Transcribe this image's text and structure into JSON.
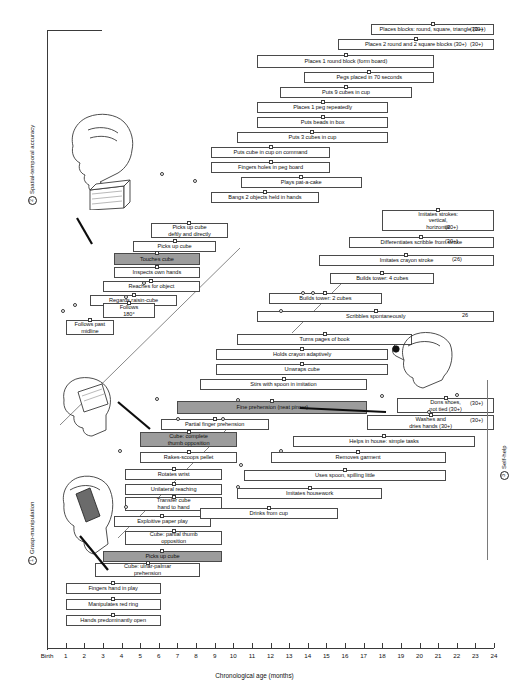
{
  "figure": {
    "axis": {
      "title": "Chronological age (months)",
      "ticks": [
        "Birth",
        "1",
        "2",
        "3",
        "4",
        "5",
        "6",
        "7",
        "8",
        "9",
        "10",
        "11",
        "12",
        "13",
        "14",
        "15",
        "16",
        "17",
        "18",
        "19",
        "20",
        "21",
        "22",
        "23",
        "24"
      ]
    },
    "side_labels": {
      "top_left": {
        "number": "2",
        "text": "Spatial-temporal accuracy"
      },
      "bottom_left": {
        "number": "1",
        "text": "Grasp-manipulation"
      },
      "right": {
        "number": "3",
        "text": "Self-help"
      }
    }
  },
  "chart_data": {
    "type": "bar",
    "xlabel": "Chronological age (months)",
    "ylabel": "",
    "xlim": [
      0,
      24
    ],
    "grid": false,
    "legend": "none",
    "groups": [
      {
        "id": "spatial-temporal-accuracy",
        "number": "2",
        "label": "Spatial-temporal accuracy"
      },
      {
        "id": "grasp-manipulation",
        "number": "1",
        "label": "Grasp-manipulation"
      },
      {
        "id": "self-help",
        "number": "3",
        "label": "Self-help"
      }
    ],
    "milestones": [
      {
        "label": "Places blocks: round, square, triangle (30+)",
        "start": 17.4,
        "end": 24.0,
        "group": "spatial-temporal-accuracy",
        "note": "(30+)",
        "highlight": false
      },
      {
        "label": "Places 2 round and 2 square blocks (30+)",
        "start": 15.6,
        "end": 24.0,
        "group": "spatial-temporal-accuracy",
        "note": "(30+)",
        "highlight": false
      },
      {
        "label": "Places 1 round block (form board)",
        "start": 11.3,
        "end": 20.8,
        "group": "spatial-temporal-accuracy",
        "note": "",
        "highlight": false
      },
      {
        "label": "Pegs placed in 70 seconds",
        "start": 13.8,
        "end": 20.8,
        "group": "spatial-temporal-accuracy",
        "note": "",
        "highlight": false
      },
      {
        "label": "Puts 9 cubes in cup",
        "start": 12.5,
        "end": 19.6,
        "group": "spatial-temporal-accuracy",
        "note": "",
        "highlight": false
      },
      {
        "label": "Places 1 peg repeatedly",
        "start": 11.3,
        "end": 18.3,
        "group": "spatial-temporal-accuracy",
        "note": "",
        "highlight": false
      },
      {
        "label": "Puts beads in box",
        "start": 11.3,
        "end": 18.3,
        "group": "spatial-temporal-accuracy",
        "note": "",
        "highlight": false
      },
      {
        "label": "Puts 3 cubes in cup",
        "start": 10.2,
        "end": 18.3,
        "group": "spatial-temporal-accuracy",
        "note": "",
        "highlight": false
      },
      {
        "label": "Puts cube in cup on command",
        "start": 8.8,
        "end": 15.2,
        "group": "spatial-temporal-accuracy",
        "note": "",
        "highlight": false
      },
      {
        "label": "Fingers holes  in peg board",
        "start": 8.8,
        "end": 15.2,
        "group": "spatial-temporal-accuracy",
        "note": "",
        "highlight": false
      },
      {
        "label": "Plays pat-a-cake",
        "start": 10.4,
        "end": 16.9,
        "group": "spatial-temporal-accuracy",
        "note": "",
        "highlight": false
      },
      {
        "label": "Bangs 2 objects held in hands",
        "start": 8.8,
        "end": 14.6,
        "group": "spatial-temporal-accuracy",
        "note": "",
        "highlight": false
      },
      {
        "label": "Picks up cube\ndeftly and directly",
        "start": 5.6,
        "end": 9.7,
        "group": "spatial-temporal-accuracy",
        "note": "",
        "highlight": false
      },
      {
        "label": "Picks up cube",
        "start": 4.6,
        "end": 9.1,
        "group": "spatial-temporal-accuracy",
        "note": "",
        "highlight": false
      },
      {
        "label": "Touches cube",
        "start": 3.6,
        "end": 8.2,
        "group": "spatial-temporal-accuracy",
        "note": "",
        "highlight": true
      },
      {
        "label": "Inspects own hands",
        "start": 3.6,
        "end": 8.2,
        "group": "spatial-temporal-accuracy",
        "note": "",
        "highlight": false
      },
      {
        "label": "Reaches for object",
        "start": 3.0,
        "end": 8.2,
        "group": "spatial-temporal-accuracy",
        "note": "",
        "highlight": false
      },
      {
        "label": "Regards raisin-cube",
        "start": 2.3,
        "end": 7.0,
        "group": "spatial-temporal-accuracy",
        "note": "",
        "highlight": false
      },
      {
        "label": "Follows\n180°",
        "start": 3.0,
        "end": 5.8,
        "group": "spatial-temporal-accuracy",
        "note": "",
        "highlight": false
      },
      {
        "label": "Follows past\nmidline",
        "start": 1.0,
        "end": 3.6,
        "group": "spatial-temporal-accuracy",
        "note": "",
        "highlight": false
      },
      {
        "label": "Imitates strokes:\nvertical,\nhorizontal",
        "start": 18.0,
        "end": 24.0,
        "group": "spatial-temporal-accuracy",
        "note": "(30+)",
        "highlight": false
      },
      {
        "label": "Differentiates scribble from stroke",
        "start": 16.2,
        "end": 24.0,
        "group": "spatial-temporal-accuracy",
        "note": "(30+)",
        "highlight": false
      },
      {
        "label": "Imitates crayon stroke",
        "start": 14.6,
        "end": 24.0,
        "group": "spatial-temporal-accuracy",
        "note": "(26)",
        "highlight": false
      },
      {
        "label": "Builds tower: 4 cubes",
        "start": 15.2,
        "end": 20.8,
        "group": "spatial-temporal-accuracy",
        "note": "",
        "highlight": false
      },
      {
        "label": "Builds tower: 2 cubes",
        "start": 11.9,
        "end": 18.0,
        "group": "spatial-temporal-accuracy",
        "note": "",
        "highlight": false
      },
      {
        "label": "Scribbles spontaneously",
        "start": 11.3,
        "end": 24.0,
        "group": "spatial-temporal-accuracy",
        "note": "26",
        "highlight": false
      },
      {
        "label": "Turns pages of book",
        "start": 10.2,
        "end": 19.6,
        "group": "spatial-temporal-accuracy",
        "note": "",
        "highlight": false
      },
      {
        "label": "Holds crayon adaptively",
        "start": 9.1,
        "end": 18.3,
        "group": "spatial-temporal-accuracy",
        "note": "",
        "highlight": false
      },
      {
        "label": "Unwraps cube",
        "start": 9.1,
        "end": 18.3,
        "group": "spatial-temporal-accuracy",
        "note": "",
        "highlight": false
      },
      {
        "label": "Stirs with spoon in imitation",
        "start": 8.2,
        "end": 17.2,
        "group": "spatial-temporal-accuracy",
        "note": "",
        "highlight": false
      },
      {
        "label": "Fine prehension (neat pincer)",
        "start": 7.0,
        "end": 17.2,
        "group": "grasp-manipulation",
        "note": "",
        "highlight": true
      },
      {
        "label": "Partial finger prehension",
        "start": 6.1,
        "end": 11.9,
        "group": "grasp-manipulation",
        "note": "",
        "highlight": false
      },
      {
        "label": "Cube: complete\nthumb opposition",
        "start": 5.0,
        "end": 10.2,
        "group": "grasp-manipulation",
        "note": "",
        "highlight": true
      },
      {
        "label": "Rakes-scoops pellet",
        "start": 5.0,
        "end": 10.2,
        "group": "grasp-manipulation",
        "note": "",
        "highlight": false
      },
      {
        "label": "Rotates wrist",
        "start": 4.2,
        "end": 9.4,
        "group": "grasp-manipulation",
        "note": "",
        "highlight": false
      },
      {
        "label": "Unilateral reaching",
        "start": 4.2,
        "end": 9.4,
        "group": "grasp-manipulation",
        "note": "",
        "highlight": false
      },
      {
        "label": "Transfer cube\nhand to hand",
        "start": 4.2,
        "end": 9.4,
        "group": "grasp-manipulation",
        "note": "",
        "highlight": false
      },
      {
        "label": "Exploitive paper play",
        "start": 3.6,
        "end": 8.8,
        "group": "grasp-manipulation",
        "note": "",
        "highlight": false
      },
      {
        "label": "Cube: partial thumb\nopposition",
        "start": 4.2,
        "end": 9.4,
        "group": "grasp-manipulation",
        "note": "",
        "highlight": false
      },
      {
        "label": "Picks up cube",
        "start": 3.0,
        "end": 9.4,
        "group": "grasp-manipulation",
        "note": "",
        "highlight": true
      },
      {
        "label": "Cube: ulnar-palmar\nprehension",
        "start": 2.6,
        "end": 8.2,
        "group": "grasp-manipulation",
        "note": "",
        "highlight": false
      },
      {
        "label": "Fingers hand in play",
        "start": 1.0,
        "end": 6.1,
        "group": "grasp-manipulation",
        "note": "",
        "highlight": false
      },
      {
        "label": "Manipulates red ring",
        "start": 1.0,
        "end": 6.1,
        "group": "grasp-manipulation",
        "note": "",
        "highlight": false
      },
      {
        "label": "Hands predominantly open",
        "start": 1.0,
        "end": 6.1,
        "group": "grasp-manipulation",
        "note": "",
        "highlight": false
      },
      {
        "label": "Dons shoes,\nnot tied (30+)",
        "start": 18.8,
        "end": 24.0,
        "group": "self-help",
        "note": "(30+)",
        "highlight": false
      },
      {
        "label": "Washes and\ndries hands (30+)",
        "start": 17.2,
        "end": 24.0,
        "group": "self-help",
        "note": "(30+)",
        "highlight": false
      },
      {
        "label": "Helps in house: simple tasks",
        "start": 13.2,
        "end": 23.0,
        "group": "self-help",
        "note": "",
        "highlight": false
      },
      {
        "label": "Removes garment",
        "start": 12.0,
        "end": 21.4,
        "group": "self-help",
        "note": "",
        "highlight": false
      },
      {
        "label": "Uses spoon, spilling little",
        "start": 10.6,
        "end": 21.4,
        "group": "self-help",
        "note": "",
        "highlight": false
      },
      {
        "label": "Imitates housework",
        "start": 10.2,
        "end": 18.0,
        "group": "self-help",
        "note": "",
        "highlight": false
      },
      {
        "label": "Drinks from cup",
        "start": 8.2,
        "end": 15.6,
        "group": "self-help",
        "note": "",
        "highlight": false
      }
    ]
  }
}
